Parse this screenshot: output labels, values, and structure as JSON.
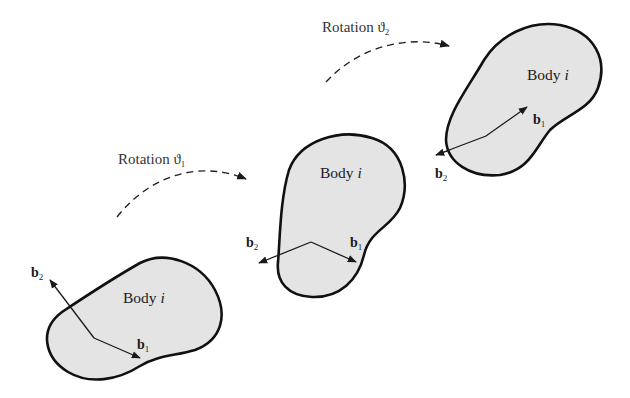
{
  "figure": {
    "bodies": [
      {
        "label": "Body ",
        "index": "i",
        "b1": {
          "base": "b",
          "sub": "1"
        },
        "b2": {
          "base": "b",
          "sub": "2"
        }
      },
      {
        "label": "Body ",
        "index": "i",
        "b1": {
          "base": "b",
          "sub": "1"
        },
        "b2": {
          "base": "b",
          "sub": "2"
        }
      },
      {
        "label": "Body ",
        "index": "i",
        "b1": {
          "base": "b",
          "sub": "1"
        },
        "b2": {
          "base": "b",
          "sub": "2"
        }
      }
    ],
    "rotations": [
      {
        "label": "Rotation ",
        "symbol": "ϑ",
        "sub": "1"
      },
      {
        "label": "Rotation ",
        "symbol": "ϑ",
        "sub": "2"
      }
    ],
    "colors": {
      "body_fill": "#e4e4e4",
      "outline": "#111111",
      "background": "#ffffff"
    }
  }
}
